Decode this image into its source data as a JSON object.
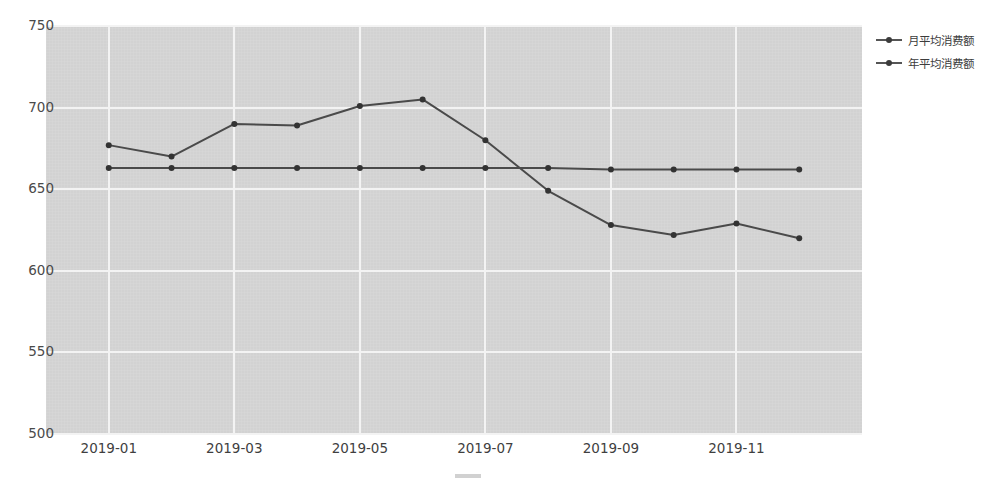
{
  "chart_data": {
    "type": "line",
    "title": "",
    "subtitle": "",
    "xlabel": "",
    "ylabel": "",
    "x": [
      "2019-01",
      "2019-02",
      "2019-03",
      "2019-04",
      "2019-05",
      "2019-06",
      "2019-07",
      "2019-08",
      "2019-09",
      "2019-10",
      "2019-11",
      "2019-12"
    ],
    "xtick_labels": [
      "2019-01",
      "2019-03",
      "2019-05",
      "2019-07",
      "2019-09",
      "2019-11"
    ],
    "xtick_values": [
      "2019-01",
      "2019-03",
      "2019-05",
      "2019-07",
      "2019-09",
      "2019-11"
    ],
    "ytick_labels": [
      "750",
      "700",
      "650",
      "600",
      "550",
      "500"
    ],
    "ytick_values": [
      750,
      700,
      650,
      600,
      550,
      500
    ],
    "ylim": [
      500,
      750
    ],
    "grid": true,
    "legend_position": "outside top-right",
    "series": [
      {
        "name": "月平均消费额",
        "color": "#4a4a4a",
        "marker": "circle",
        "values": [
          677,
          670,
          690,
          689,
          701,
          705,
          680,
          649,
          628,
          622,
          629,
          620
        ]
      },
      {
        "name": "年平均消费额",
        "color": "#4a4a4a",
        "marker": "circle",
        "values": [
          663,
          663,
          663,
          663,
          663,
          663,
          663,
          663,
          662,
          662,
          662,
          662
        ]
      }
    ]
  },
  "legend": {
    "items": [
      {
        "label": "月平均消费额"
      },
      {
        "label": "年平均消费额"
      }
    ]
  },
  "style": {
    "plot_background": "#d5d5d5",
    "gridline_color": "#f3f3f3",
    "line_color": "#4a4a4a",
    "marker_color": "#333333",
    "tick_label_color": "#4a4a4a",
    "page_background": "#ffffff"
  }
}
